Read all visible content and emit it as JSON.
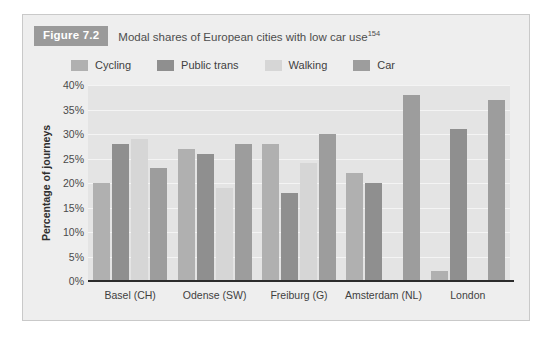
{
  "figure": {
    "tag": "Figure 7.2",
    "caption": "Modal shares of European cities with low car use",
    "caption_footnote": "154"
  },
  "colors": {
    "card_background": "#eeeeee",
    "plot_background": "#e4e4e4",
    "gridline": "#f4f4f4",
    "axis": "#2b2b2b",
    "tag_background": "#9a9a9a",
    "cycling": "#b0b0b0",
    "public_trans": "#8f8f8f",
    "walking": "#d6d6d6",
    "car": "#9d9d9d"
  },
  "chart_data": {
    "type": "bar",
    "title": "Modal shares of European cities with low car use",
    "xlabel": "",
    "ylabel": "Percentage of journeys",
    "ylim": [
      0,
      40
    ],
    "ytick_labels": [
      "0%",
      "5%",
      "10%",
      "15%",
      "20%",
      "25%",
      "30%",
      "35%",
      "40%"
    ],
    "ytick_values": [
      0,
      5,
      10,
      15,
      20,
      25,
      30,
      35,
      40
    ],
    "grid": true,
    "legend_position": "top-left",
    "value_unit": "%",
    "categories": [
      "Basel (CH)",
      "Odense (SW)",
      "Freiburg (G)",
      "Amsterdam (NL)",
      "London"
    ],
    "series": [
      {
        "name": "Cycling",
        "color": "#b0b0b0",
        "values": [
          20,
          27,
          28,
          22,
          2
        ]
      },
      {
        "name": "Public trans",
        "color": "#8f8f8f",
        "values": [
          28,
          26,
          18,
          20,
          31
        ]
      },
      {
        "name": "Walking",
        "color": "#d6d6d6",
        "values": [
          29,
          19,
          24,
          null,
          null
        ]
      },
      {
        "name": "Car",
        "color": "#9d9d9d",
        "values": [
          23,
          28,
          30,
          38,
          37
        ]
      }
    ]
  }
}
